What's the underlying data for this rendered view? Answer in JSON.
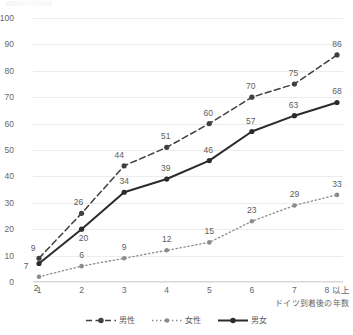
{
  "chart_data": {
    "type": "line",
    "title": "",
    "xlabel": "ドイツ到着後の年数",
    "ylabel": "",
    "ylim": [
      0,
      100
    ],
    "ytick_step": 10,
    "yticks": [
      "0",
      "10",
      "20",
      "30",
      "40",
      "50",
      "60",
      "70",
      "80",
      "90",
      "100"
    ],
    "categories": [
      "1",
      "2",
      "3",
      "4",
      "5",
      "6",
      "7",
      "8 以上"
    ],
    "grid": "horizontal",
    "legend_position": "bottom-center",
    "series": [
      {
        "name": "男性",
        "style": "dashed",
        "color": "#3f3f3f",
        "values": [
          9,
          26,
          44,
          51,
          60,
          70,
          75,
          86
        ],
        "labels": [
          "9",
          "26",
          "44",
          "51",
          "60",
          "70",
          "75",
          "86"
        ]
      },
      {
        "name": "女性",
        "style": "dotted",
        "color": "#8c8c8c",
        "values": [
          2,
          6,
          9,
          12,
          15,
          23,
          29,
          33
        ],
        "labels": [
          "2",
          "6",
          "9",
          "12",
          "15",
          "23",
          "29",
          "33"
        ]
      },
      {
        "name": "男女",
        "style": "solid",
        "color": "#2b2b2b",
        "values": [
          7,
          20,
          34,
          39,
          46,
          57,
          63,
          68
        ],
        "labels": [
          "7",
          "20",
          "34",
          "39",
          "46",
          "57",
          "63",
          "68"
        ]
      }
    ]
  },
  "legend": {
    "items": [
      {
        "label": "男性"
      },
      {
        "label": "女性"
      },
      {
        "label": "男女"
      }
    ]
  },
  "axes": {
    "x_title": "ドイツ到着後の年数"
  }
}
